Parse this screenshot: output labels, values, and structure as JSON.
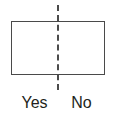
{
  "figure": {
    "type": "split-rectangle-diagram",
    "background_color": "#ffffff",
    "shape": {
      "name": "rectangle",
      "stroke_color": "#4a4a4a",
      "stroke_width_px": 1.5,
      "fill_color": "#ffffff",
      "x": 11,
      "y": 21,
      "width": 94,
      "height": 54
    },
    "divider": {
      "name": "vertical-dashed-line",
      "style": "dashed",
      "stroke_color": "#4a4a4a",
      "stroke_width_px": 2,
      "x": 58,
      "y_top": 5,
      "y_bottom": 90
    },
    "labels": {
      "left": "Yes",
      "right": "No",
      "text_color": "#231f20",
      "font_size_px": 16
    }
  }
}
